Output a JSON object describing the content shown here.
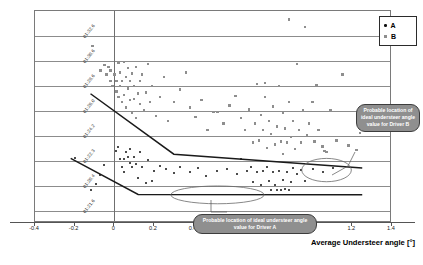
{
  "chart_data": {
    "type": "scatter",
    "title": "",
    "xlabel": "Average Understeer angle [°]",
    "ylabel": "Lap Time",
    "xlim": [
      -0.4,
      1.4
    ],
    "xticks": [
      "-0.4",
      "-0.2",
      "0",
      "0.2",
      "0.4",
      "0.6",
      "0.8",
      "1",
      "1.2",
      "1.4"
    ],
    "xtick_values": [
      -0.4,
      -0.2,
      0,
      0.2,
      0.4,
      0.6,
      0.8,
      1.0,
      1.2,
      1.4
    ],
    "yticks": [
      "01:32.6",
      "01:30.6",
      "01:28.6",
      "01:26.0",
      "01:24.2",
      "01:22.3",
      "01:20.4",
      "01:21.6"
    ],
    "grid": true,
    "legend_position": "top-right",
    "series": [
      {
        "name": "A",
        "marker": "circle",
        "color": "#101010",
        "points": [
          [
            -0.2,
            0.695
          ],
          [
            -0.12,
            0.845
          ],
          [
            -0.09,
            0.815
          ],
          [
            -0.07,
            0.775
          ],
          [
            -0.05,
            0.725
          ],
          [
            0.01,
            0.66
          ],
          [
            0.02,
            0.64
          ],
          [
            0.03,
            0.7
          ],
          [
            0.04,
            0.735
          ],
          [
            0.05,
            0.76
          ],
          [
            0.05,
            0.7
          ],
          [
            0.06,
            0.665
          ],
          [
            0.07,
            0.69
          ],
          [
            0.08,
            0.715
          ],
          [
            0.08,
            0.65
          ],
          [
            0.09,
            0.735
          ],
          [
            0.1,
            0.69
          ],
          [
            0.11,
            0.72
          ],
          [
            0.12,
            0.79
          ],
          [
            0.13,
            0.665
          ],
          [
            0.14,
            0.735
          ],
          [
            0.16,
            0.81
          ],
          [
            0.17,
            0.705
          ],
          [
            0.19,
            0.8
          ],
          [
            0.2,
            0.755
          ],
          [
            0.23,
            0.73
          ],
          [
            0.26,
            0.745
          ],
          [
            0.3,
            0.765
          ],
          [
            0.33,
            0.735
          ],
          [
            0.38,
            0.76
          ],
          [
            0.42,
            0.74
          ],
          [
            0.46,
            0.78
          ],
          [
            0.52,
            0.755
          ],
          [
            0.57,
            0.745
          ],
          [
            0.62,
            0.77
          ],
          [
            0.64,
            0.7
          ],
          [
            0.67,
            0.755
          ],
          [
            0.69,
            0.735
          ],
          [
            0.7,
            0.805
          ],
          [
            0.72,
            0.76
          ],
          [
            0.74,
            0.82
          ],
          [
            0.75,
            0.755
          ],
          [
            0.77,
            0.735
          ],
          [
            0.78,
            0.8
          ],
          [
            0.79,
            0.845
          ],
          [
            0.8,
            0.76
          ],
          [
            0.81,
            0.82
          ],
          [
            0.82,
            0.845
          ],
          [
            0.83,
            0.755
          ],
          [
            0.84,
            0.845
          ],
          [
            0.85,
            0.795
          ],
          [
            0.86,
            0.84
          ],
          [
            0.87,
            0.76
          ],
          [
            0.88,
            0.845
          ],
          [
            0.89,
            0.805
          ],
          [
            0.9,
            0.74
          ],
          [
            0.92,
            0.77
          ],
          [
            0.94,
            0.75
          ],
          [
            0.96,
            0.8
          ],
          [
            1.0,
            0.745
          ],
          [
            1.05,
            0.76
          ],
          [
            1.1,
            0.74
          ]
        ]
      },
      {
        "name": "B",
        "marker": "square",
        "color": "#8e8e8e",
        "points": [
          [
            -0.11,
            0.165
          ],
          [
            -0.07,
            0.28
          ],
          [
            -0.05,
            0.255
          ],
          [
            -0.04,
            0.3
          ],
          [
            -0.03,
            0.265
          ],
          [
            -0.02,
            0.33
          ],
          [
            -0.02,
            0.28
          ],
          [
            -0.01,
            0.355
          ],
          [
            0.0,
            0.3
          ],
          [
            0.01,
            0.38
          ],
          [
            0.01,
            0.33
          ],
          [
            0.02,
            0.245
          ],
          [
            0.02,
            0.405
          ],
          [
            0.03,
            0.355
          ],
          [
            0.03,
            0.29
          ],
          [
            0.04,
            0.43
          ],
          [
            0.04,
            0.33
          ],
          [
            0.05,
            0.24
          ],
          [
            0.05,
            0.395
          ],
          [
            0.06,
            0.31
          ],
          [
            0.06,
            0.455
          ],
          [
            0.07,
            0.365
          ],
          [
            0.07,
            0.27
          ],
          [
            0.08,
            0.42
          ],
          [
            0.08,
            0.33
          ],
          [
            0.09,
            0.295
          ],
          [
            0.09,
            0.48
          ],
          [
            0.1,
            0.355
          ],
          [
            0.1,
            0.415
          ],
          [
            0.11,
            0.265
          ],
          [
            0.11,
            0.505
          ],
          [
            0.12,
            0.39
          ],
          [
            0.13,
            0.33
          ],
          [
            0.13,
            0.44
          ],
          [
            0.14,
            0.3
          ],
          [
            0.15,
            0.47
          ],
          [
            0.16,
            0.385
          ],
          [
            0.17,
            0.25
          ],
          [
            0.18,
            0.43
          ],
          [
            0.19,
            0.355
          ],
          [
            0.21,
            0.495
          ],
          [
            0.23,
            0.405
          ],
          [
            0.25,
            0.31
          ],
          [
            0.27,
            0.52
          ],
          [
            0.3,
            0.43
          ],
          [
            0.33,
            0.37
          ],
          [
            0.36,
            0.29
          ],
          [
            0.38,
            0.455
          ],
          [
            0.41,
            0.5
          ],
          [
            0.44,
            0.42
          ],
          [
            0.47,
            0.56
          ],
          [
            0.5,
            0.475
          ],
          [
            0.52,
            0.475
          ],
          [
            0.55,
            0.53
          ],
          [
            0.58,
            0.445
          ],
          [
            0.61,
            0.4
          ],
          [
            0.64,
            0.505
          ],
          [
            0.66,
            0.56
          ],
          [
            0.68,
            0.465
          ],
          [
            0.7,
            0.62
          ],
          [
            0.71,
            0.53
          ],
          [
            0.72,
            0.345
          ],
          [
            0.73,
            0.61
          ],
          [
            0.74,
            0.49
          ],
          [
            0.75,
            0.56
          ],
          [
            0.76,
            0.405
          ],
          [
            0.76,
            0.34
          ],
          [
            0.77,
            0.645
          ],
          [
            0.78,
            0.52
          ],
          [
            0.79,
            0.58
          ],
          [
            0.8,
            0.45
          ],
          [
            0.81,
            0.63
          ],
          [
            0.82,
            0.545
          ],
          [
            0.83,
            0.355
          ],
          [
            0.84,
            0.615
          ],
          [
            0.85,
            0.48
          ],
          [
            0.85,
            0.675
          ],
          [
            0.86,
            0.555
          ],
          [
            0.87,
            0.62
          ],
          [
            0.88,
            0.43
          ],
          [
            0.88,
            0.04
          ],
          [
            0.89,
            0.595
          ],
          [
            0.9,
            0.52
          ],
          [
            0.91,
            0.65
          ],
          [
            0.92,
            0.25
          ],
          [
            0.93,
            0.56
          ],
          [
            0.94,
            0.62
          ],
          [
            0.95,
            0.47
          ],
          [
            0.96,
            0.075
          ],
          [
            0.97,
            0.585
          ],
          [
            0.98,
            0.53
          ],
          [
            1.0,
            0.43
          ],
          [
            1.01,
            0.615
          ],
          [
            1.02,
            0.35
          ],
          [
            1.03,
            0.56
          ],
          [
            1.05,
            0.64
          ],
          [
            1.06,
            0.66
          ],
          [
            1.07,
            0.665
          ],
          [
            1.09,
            0.47
          ],
          [
            1.12,
            0.61
          ],
          [
            1.15,
            0.3
          ],
          [
            1.18,
            0.635
          ],
          [
            1.22,
            0.655
          ],
          [
            1.24,
            0.575
          ]
        ]
      }
    ],
    "trend_lines": [
      {
        "name": "driver-b-trend",
        "points": [
          [
            -0.115,
            0.395
          ],
          [
            0.305,
            0.68
          ],
          [
            1.255,
            0.745
          ]
        ]
      },
      {
        "name": "driver-a-trend",
        "points": [
          [
            -0.215,
            0.7
          ],
          [
            0.125,
            0.87
          ],
          [
            1.255,
            0.872
          ]
        ]
      }
    ],
    "annotations": [
      {
        "name": "ideal-region-b",
        "shape": "ellipse",
        "cx": 1.075,
        "cy": 0.755,
        "rx": 0.125,
        "ry": 0.055
      },
      {
        "name": "ideal-region-a",
        "shape": "ellipse",
        "cx": 0.525,
        "cy": 0.872,
        "rx": 0.235,
        "ry": 0.042
      }
    ]
  },
  "legend": {
    "items": [
      {
        "label": "A",
        "marker": "circle",
        "color": "#101010"
      },
      {
        "label": "B",
        "marker": "square",
        "color": "#8e8e8e"
      }
    ]
  },
  "callouts": {
    "driver_b": "Probable location of ideal understeer angle value for Driver B",
    "driver_a": "Probable location of ideal understeer angle value for Driver A"
  }
}
